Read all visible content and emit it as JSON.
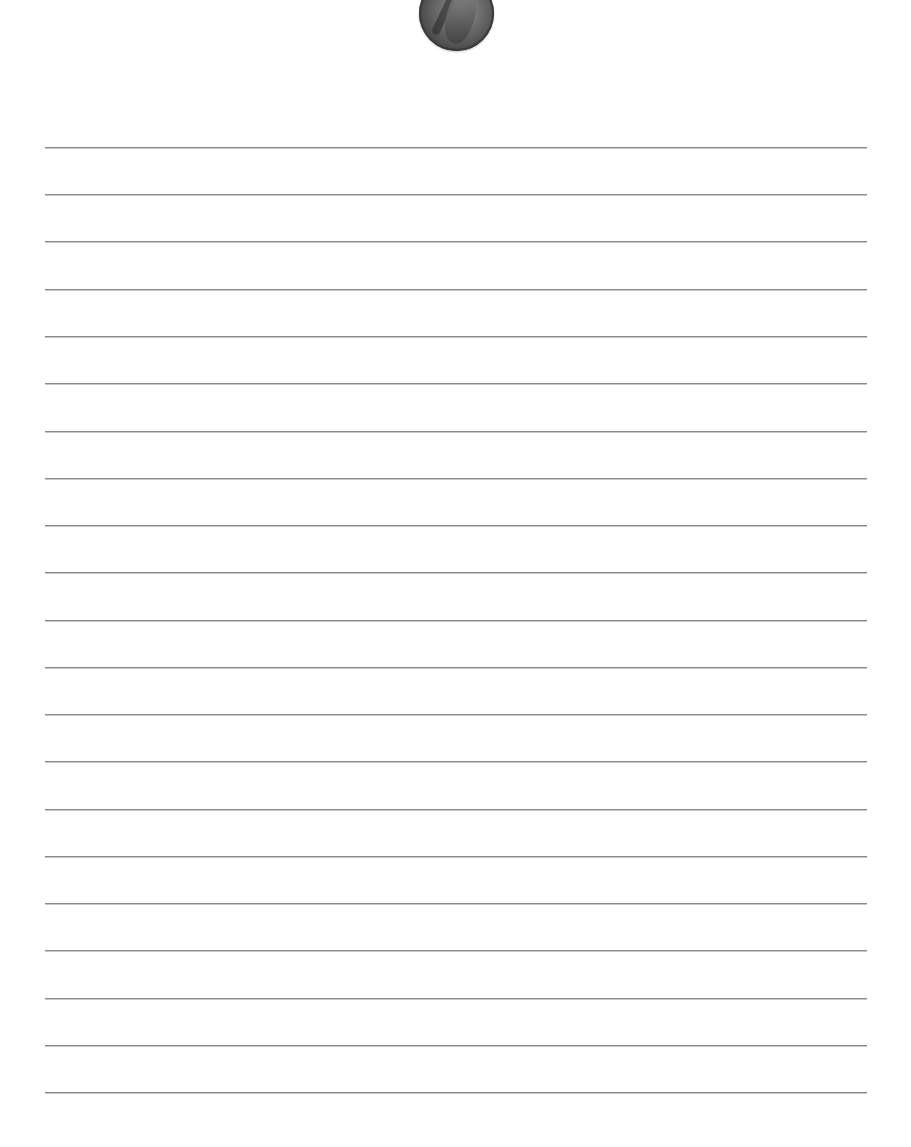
{
  "page": {
    "type": "lined-paper",
    "background_color": "#ffffff",
    "line_color": "#8a8a8a",
    "line_count": 21,
    "line_left_px": 45,
    "line_right_px": 867,
    "first_line_y_px": 147,
    "line_spacing_px": 47.25
  },
  "header_image": {
    "icon": "coin-icon",
    "description": "penny coin with profile portrait, cropped at top edge"
  },
  "lines": [
    {
      "y": 147
    },
    {
      "y": 194
    },
    {
      "y": 241
    },
    {
      "y": 289
    },
    {
      "y": 336
    },
    {
      "y": 383
    },
    {
      "y": 431
    },
    {
      "y": 478
    },
    {
      "y": 525
    },
    {
      "y": 572
    },
    {
      "y": 620
    },
    {
      "y": 667
    },
    {
      "y": 714
    },
    {
      "y": 761
    },
    {
      "y": 809
    },
    {
      "y": 856
    },
    {
      "y": 903
    },
    {
      "y": 950
    },
    {
      "y": 998
    },
    {
      "y": 1045
    },
    {
      "y": 1092
    }
  ]
}
